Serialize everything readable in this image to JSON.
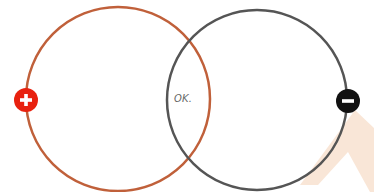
{
  "diagram": {
    "type": "venn",
    "circles": [
      {
        "id": "positive",
        "cx": 118,
        "cy": 99,
        "r": 92,
        "stroke": "#c0603a",
        "stroke_width": 2.5
      },
      {
        "id": "negative",
        "cx": 257,
        "cy": 100,
        "r": 90,
        "stroke": "#555555",
        "stroke_width": 2.5
      }
    ],
    "overlap_label": "OK.",
    "markers": [
      {
        "id": "plus",
        "symbol": "+",
        "icon": "plus-icon",
        "cx": 26,
        "cy": 100,
        "r": 12,
        "fill": "#e8210f",
        "glyph_color": "#ffffff"
      },
      {
        "id": "minus",
        "symbol": "−",
        "icon": "minus-icon",
        "cx": 348,
        "cy": 101,
        "r": 12,
        "fill": "#111111",
        "glyph_color": "#ffffff"
      }
    ],
    "background_shape": {
      "type": "chevron-up",
      "fill": "#f8e3d3"
    }
  }
}
